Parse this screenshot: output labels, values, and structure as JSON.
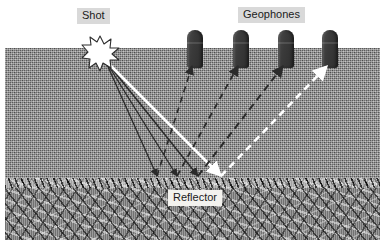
{
  "figure": {
    "type": "seismic-reflection-survey-diagram",
    "title_visible": false
  },
  "labels": {
    "shot": "Shot",
    "geophones": "Geophones",
    "reflector": "Reflector"
  },
  "colors": {
    "soil": "#8d8d8d",
    "rock": "#8a8a8a",
    "geophone": "#3a3a3a",
    "ray_dark": "#2b2b2b",
    "ray_light": "#ffffff",
    "label_gray_bg": "#d9d9d9",
    "label_white_bg": "#f3f2ee",
    "label_text": "#1b1b1b",
    "background": "#ffffff"
  },
  "geometry": {
    "ground_surface_y": 48,
    "reflector_top_y": 178,
    "shot_x": 95,
    "shot_y": 52
  },
  "shot": {
    "name": "Shot",
    "marker": "starburst",
    "x": 95,
    "y": 52
  },
  "geophones": [
    {
      "id": 1,
      "x": 190,
      "y": 30,
      "label": "Geophone 1"
    },
    {
      "id": 2,
      "x": 236,
      "y": 30,
      "label": "Geophone 2"
    },
    {
      "id": 3,
      "x": 281,
      "y": 30,
      "label": "Geophone 3"
    },
    {
      "id": 4,
      "x": 325,
      "y": 30,
      "label": "Geophone 4"
    }
  ],
  "raypaths": [
    {
      "id": 1,
      "geophone": 1,
      "style": "solid",
      "color": "dark",
      "segment": "downgoing",
      "from": [
        100,
        60
      ],
      "to": [
        152,
        176
      ]
    },
    {
      "id": 2,
      "geophone": 2,
      "style": "solid",
      "color": "dark",
      "segment": "downgoing",
      "from": [
        100,
        60
      ],
      "to": [
        172,
        176
      ]
    },
    {
      "id": 3,
      "geophone": 3,
      "style": "solid",
      "color": "dark",
      "segment": "downgoing",
      "from": [
        100,
        60
      ],
      "to": [
        193,
        176
      ]
    },
    {
      "id": 4,
      "geophone": 4,
      "style": "solid",
      "color": "light",
      "segment": "downgoing",
      "from": [
        100,
        60
      ],
      "to": [
        216,
        176
      ]
    },
    {
      "id": 5,
      "geophone": 1,
      "style": "dashed",
      "color": "dark",
      "segment": "upgoing",
      "from": [
        152,
        176
      ],
      "to": [
        187,
        66
      ]
    },
    {
      "id": 6,
      "geophone": 2,
      "style": "dashed",
      "color": "dark",
      "segment": "upgoing",
      "from": [
        172,
        176
      ],
      "to": [
        233,
        66
      ]
    },
    {
      "id": 7,
      "geophone": 3,
      "style": "dashed",
      "color": "dark",
      "segment": "upgoing",
      "from": [
        193,
        176
      ],
      "to": [
        278,
        66
      ]
    },
    {
      "id": 8,
      "geophone": 4,
      "style": "dashed",
      "color": "light",
      "segment": "upgoing",
      "from": [
        216,
        176
      ],
      "to": [
        322,
        66
      ]
    }
  ],
  "label_positions": {
    "shot": {
      "left": 72,
      "top": 8
    },
    "geophones": {
      "left": 233,
      "top": 7
    },
    "reflector": {
      "left": 163,
      "top": 190
    }
  }
}
